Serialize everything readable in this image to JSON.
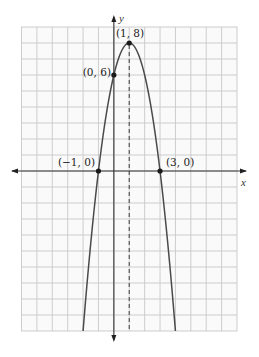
{
  "chart_data": {
    "type": "line",
    "title": "",
    "function": "y = -2x^2 + 4x + 6",
    "xlabel": "x",
    "ylabel": "y",
    "xlim": [
      -6,
      8
    ],
    "ylim": [
      -10,
      9
    ],
    "grid": true,
    "grid_step": 1,
    "axis_of_symmetry": {
      "x": 1,
      "style": "dashed"
    },
    "series": [
      {
        "name": "parabola",
        "x": [
          -2,
          -1,
          0,
          1,
          2,
          3,
          4
        ],
        "y": [
          -10,
          0,
          6,
          8,
          6,
          0,
          -10
        ]
      }
    ],
    "points": [
      {
        "x": 1,
        "y": 8,
        "label": "(1, 8)",
        "role": "vertex"
      },
      {
        "x": 0,
        "y": 6,
        "label": "(0, 6)",
        "role": "y-intercept"
      },
      {
        "x": -1,
        "y": 0,
        "label": "(−1, 0)",
        "role": "x-intercept"
      },
      {
        "x": 3,
        "y": 0,
        "label": "(3, 0)",
        "role": "x-intercept"
      }
    ]
  },
  "labels": {
    "x_axis": "x",
    "y_axis": "y",
    "vertex": "(1, 8)",
    "y_intercept": "(0, 6)",
    "x_intercept_left": "(−1, 0)",
    "x_intercept_right": "(3, 0)"
  }
}
